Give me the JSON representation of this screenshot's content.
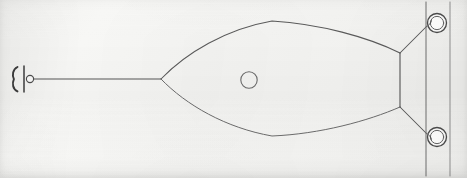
{
  "figure": {
    "title": "Technical line drawing — plan view of a lens-shaped (ogival) body on an axial shaft mounted to a panel",
    "background_color": "#f4f4f2",
    "ink_color": "#4a4a4a",
    "ink_color_light": "#7d7d7d",
    "canvas": {
      "width": 467,
      "height": 178
    }
  },
  "parts": {
    "shaft": {
      "label": "axial shaft",
      "x_start": 30,
      "x_end": 161,
      "y": 79
    },
    "shaft_end_hub": {
      "label": "shaft end hub",
      "cx": 30,
      "cy": 79,
      "r": 3.6
    },
    "shaft_end_crossbar": {
      "label": "shaft end crossbar",
      "x": 24,
      "y_top": 66,
      "y_bottom": 92
    },
    "shaft_end_bracket": {
      "label": "shaft end retaining bracket",
      "x": 14,
      "y_top": 67,
      "y_bottom": 91
    },
    "body": {
      "label": "lens-shaped body",
      "nose_x": 161,
      "nose_y": 79,
      "tail_top_x": 400,
      "tail_top_y": 53,
      "tail_bottom_x": 400,
      "tail_bottom_y": 107,
      "crest_top_y": 21,
      "crest_bottom_y": 136,
      "crest_x": 272
    },
    "body_port": {
      "label": "circular port on body",
      "cx": 249,
      "cy": 80,
      "r": 8.2
    },
    "mount_plate": {
      "label": "mounting plate edge",
      "x": 400,
      "y_top": 53,
      "y_bottom": 107
    },
    "brace_upper": {
      "label": "upper brace strut",
      "x1": 400,
      "y1": 53,
      "x2": 427,
      "y2": 26
    },
    "brace_lower": {
      "label": "lower brace strut",
      "x1": 400,
      "y1": 107,
      "x2": 427,
      "y2": 134
    },
    "panel_line_inner": {
      "label": "panel inner edge line",
      "x": 426,
      "y_top": 2,
      "y_bottom": 176
    },
    "panel_line_outer": {
      "label": "panel outer edge line",
      "x": 450,
      "y_top": 2,
      "y_bottom": 176
    },
    "eyelet_top": {
      "label": "upper ring eyelet",
      "cx": 437,
      "cy": 23,
      "rx": 9.5,
      "ry": 9.5
    },
    "eyelet_bottom": {
      "label": "lower ring eyelet",
      "cx": 437,
      "cy": 137,
      "rx": 9.5,
      "ry": 9.5
    }
  },
  "annotations": {
    "count_eyelets": "2",
    "count_circles": "3",
    "view": "plan view"
  }
}
